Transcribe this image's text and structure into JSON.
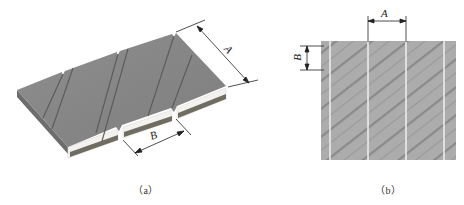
{
  "figure": {
    "panels": [
      {
        "id": "a",
        "caption": "（a）",
        "description": "Isometric view of diagonally scored strip segments",
        "dimensions": {
          "A": "A",
          "B": "B"
        },
        "colors": {
          "top": "#8c8c8c",
          "top_dark": "#6f6f6f",
          "groove": "#555555",
          "edge_white": "#f2f2ee",
          "edge_dark": "#6b6a62"
        }
      },
      {
        "id": "b",
        "caption": "（b）",
        "description": "Top view texture with diagonal stripes and vertical seams",
        "dimensions": {
          "A": "A",
          "B": "B"
        },
        "colors": {
          "fill": "#acacac",
          "stripe": "#8f8f8f",
          "seam": "#e8e8e8"
        }
      }
    ]
  }
}
